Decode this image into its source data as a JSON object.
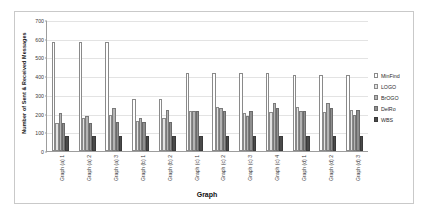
{
  "chart_data": {
    "type": "bar",
    "title": "",
    "xlabel": "Graph",
    "ylabel": "Number of Sent & Received Messages",
    "ylim": [
      0,
      700
    ],
    "yticks": [
      0,
      100,
      200,
      300,
      400,
      500,
      600,
      700
    ],
    "grid": true,
    "legend_position": "right",
    "categories": [
      "Graph (a) 1",
      "Graph (a) 2",
      "Graph (a) 3",
      "Graph (b) 1",
      "Graph (b) 2",
      "Graph (c) 1",
      "Graph (c) 2",
      "Graph (c) 3",
      "Graph (c) 4",
      "Graph (d) 1",
      "Graph (d) 2",
      "Graph (d) 3"
    ],
    "series": [
      {
        "name": "MinFind",
        "color": "#ffffff",
        "values": [
          580,
          580,
          580,
          280,
          280,
          415,
          415,
          415,
          418,
          405,
          405,
          408
        ]
      },
      {
        "name": "LOGO",
        "color": "#e2e2e2",
        "values": [
          152,
          175,
          192,
          158,
          175,
          215,
          235,
          205,
          210,
          235,
          210,
          218
        ]
      },
      {
        "name": "BrOGO",
        "color": "#b4b4b4",
        "values": [
          205,
          188,
          228,
          175,
          220,
          212,
          228,
          188,
          255,
          212,
          258,
          195
        ]
      },
      {
        "name": "DelRo",
        "color": "#8f8f8f",
        "values": [
          152,
          152,
          155,
          155,
          155,
          215,
          215,
          215,
          228,
          212,
          228,
          218
        ]
      },
      {
        "name": "WBS",
        "color": "#4a4a4a",
        "values": [
          80,
          80,
          80,
          80,
          80,
          80,
          80,
          80,
          80,
          80,
          80,
          80
        ]
      }
    ]
  }
}
